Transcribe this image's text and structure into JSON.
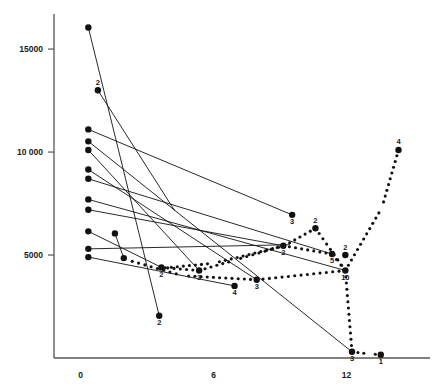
{
  "chart_data": {
    "type": "scatter",
    "title": "",
    "subtitle": "",
    "xlabel": "",
    "ylabel": "",
    "xlim": [
      -1.2,
      15.5
    ],
    "ylim": [
      0,
      16800
    ],
    "grid": false,
    "legend": null,
    "x_ticks": [
      {
        "value": 0,
        "label": "0"
      },
      {
        "value": 6,
        "label": "6"
      },
      {
        "value": 12,
        "label": "12"
      }
    ],
    "y_ticks": [
      {
        "value": 5000,
        "label": "5000"
      },
      {
        "value": 10000,
        "label": "10 000"
      },
      {
        "value": 15000,
        "label": "15000"
      }
    ],
    "series": [
      {
        "name": "solid-trajectories",
        "style": "solid-line",
        "segments": [
          {
            "points": [
              [
                0.35,
                16050
              ],
              [
                3.55,
                2050
              ]
            ],
            "start_label": "",
            "end_label": "2"
          },
          {
            "points": [
              [
                0.78,
                13000
              ],
              [
                4.25,
                7150
              ]
            ],
            "start_label": "2",
            "end_label": ""
          },
          {
            "points": [
              [
                0.35,
                11100
              ],
              [
                9.55,
                6950
              ]
            ],
            "start_label": "",
            "end_label": "3"
          },
          {
            "points": [
              [
                0.35,
                10520
              ],
              [
                12.25,
                300
              ]
            ],
            "start_label": "",
            "end_label": "3"
          },
          {
            "points": [
              [
                0.35,
                10100
              ],
              [
                5.35,
                4250
              ]
            ],
            "start_label": "",
            "end_label": "3"
          },
          {
            "points": [
              [
                0.35,
                9150
              ],
              [
                7.95,
                3800
              ]
            ],
            "start_label": "",
            "end_label": "3"
          },
          {
            "points": [
              [
                0.35,
                8700
              ],
              [
                11.35,
                5050
              ]
            ],
            "start_label": "",
            "end_label": "5"
          },
          {
            "points": [
              [
                0.35,
                7700
              ],
              [
                11.95,
                4250
              ]
            ],
            "start_label": "",
            "end_label": "10"
          },
          {
            "points": [
              [
                0.35,
                7200
              ],
              [
                9.15,
                5450
              ]
            ],
            "start_label": "",
            "end_label": "2"
          },
          {
            "points": [
              [
                0.35,
                6150
              ],
              [
                3.65,
                4400
              ]
            ],
            "start_label": "",
            "end_label": "2"
          },
          {
            "points": [
              [
                0.35,
                5300
              ],
              [
                9.45,
                5500
              ]
            ],
            "start_label": "",
            "end_label": "2"
          },
          {
            "points": [
              [
                0.35,
                4900
              ],
              [
                6.95,
                3500
              ]
            ],
            "start_label": "",
            "end_label": "4"
          },
          {
            "points": [
              [
                1.55,
                6050
              ],
              [
                1.95,
                4850
              ]
            ],
            "start_label": "",
            "end_label": ""
          }
        ]
      },
      {
        "name": "dotted-trajectories",
        "style": "dotted-line",
        "paths": [
          {
            "points": [
              [
                3.65,
                4400
              ],
              [
                5.35,
                4250
              ],
              [
                6.95,
                4750
              ],
              [
                9.15,
                5450
              ],
              [
                11.35,
                5050
              ],
              [
                11.95,
                4250
              ]
            ],
            "end_label": ""
          },
          {
            "points": [
              [
                3.55,
                4350
              ],
              [
                6.0,
                4600
              ],
              [
                9.2,
                5450
              ],
              [
                10.6,
                6300
              ],
              [
                11.95,
                4250
              ]
            ],
            "end_label": ""
          },
          {
            "points": [
              [
                2.05,
                4780
              ],
              [
                4.6,
                4000
              ],
              [
                7.95,
                3800
              ],
              [
                11.95,
                4250
              ],
              [
                13.6,
                7300
              ],
              [
                14.35,
                10100
              ]
            ],
            "end_label": "4"
          },
          {
            "points": [
              [
                11.95,
                4250
              ],
              [
                12.25,
                300
              ],
              [
                13.05,
                200
              ],
              [
                13.55,
                160
              ]
            ],
            "end_label": "1"
          }
        ]
      }
    ],
    "labeled_points": [
      {
        "x": 0.35,
        "y": 16050,
        "label": ""
      },
      {
        "x": 0.78,
        "y": 13000,
        "label": "2"
      },
      {
        "x": 0.35,
        "y": 11100,
        "label": ""
      },
      {
        "x": 0.35,
        "y": 10520,
        "label": ""
      },
      {
        "x": 0.35,
        "y": 10100,
        "label": ""
      },
      {
        "x": 0.35,
        "y": 9150,
        "label": ""
      },
      {
        "x": 0.35,
        "y": 8700,
        "label": ""
      },
      {
        "x": 0.35,
        "y": 7700,
        "label": ""
      },
      {
        "x": 0.35,
        "y": 7200,
        "label": ""
      },
      {
        "x": 0.35,
        "y": 6150,
        "label": ""
      },
      {
        "x": 0.35,
        "y": 5300,
        "label": ""
      },
      {
        "x": 0.35,
        "y": 4900,
        "label": ""
      },
      {
        "x": 1.55,
        "y": 6050,
        "label": ""
      },
      {
        "x": 1.95,
        "y": 4850,
        "label": ""
      },
      {
        "x": 3.55,
        "y": 2050,
        "label": "2"
      },
      {
        "x": 3.65,
        "y": 4400,
        "label": "2"
      },
      {
        "x": 5.35,
        "y": 4250,
        "label": "3"
      },
      {
        "x": 7.95,
        "y": 3800,
        "label": "3"
      },
      {
        "x": 6.95,
        "y": 3500,
        "label": "4"
      },
      {
        "x": 9.55,
        "y": 6950,
        "label": "3"
      },
      {
        "x": 9.15,
        "y": 5450,
        "label": "2"
      },
      {
        "x": 11.35,
        "y": 5050,
        "label": "5"
      },
      {
        "x": 11.95,
        "y": 5000,
        "label": "2"
      },
      {
        "x": 11.95,
        "y": 4250,
        "label": "10"
      },
      {
        "x": 10.6,
        "y": 6300,
        "label": "2"
      },
      {
        "x": 12.25,
        "y": 300,
        "label": "3"
      },
      {
        "x": 13.55,
        "y": 160,
        "label": "1"
      },
      {
        "x": 14.35,
        "y": 10100,
        "label": "4"
      }
    ]
  },
  "axes": {
    "x_axis_name": "x-axis",
    "y_axis_name": "y-axis"
  }
}
